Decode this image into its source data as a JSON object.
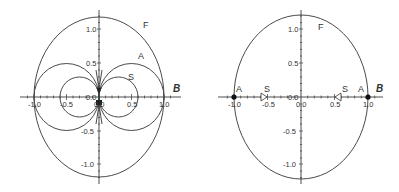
{
  "diagram": {
    "panels": [
      {
        "id": "left",
        "axis_label": "B",
        "curve_labels": {
          "F": "F",
          "A": "A",
          "S": "S"
        },
        "x_ticks": [
          "-1.0",
          "-0.5",
          "0.0",
          "0.5",
          "1.0"
        ],
        "y_ticks": [
          "1.0",
          "0.5",
          "0.0",
          "-0.5",
          "-1.0"
        ]
      },
      {
        "id": "right",
        "axis_label": "B",
        "curve_labels": {
          "F": "F",
          "A_left": "A",
          "A_right": "A",
          "S_left": "S",
          "S_right": "S"
        },
        "x_ticks": [
          "-1.0",
          "-0.5",
          "0.0",
          "0.5",
          "1.0"
        ],
        "y_ticks": [
          "1.0",
          "0.5",
          "0.0",
          "-0.5",
          "-1.0"
        ]
      }
    ],
    "colors": {
      "stroke": "#4a4a4a",
      "text": "#333333",
      "background": "#ffffff"
    }
  }
}
